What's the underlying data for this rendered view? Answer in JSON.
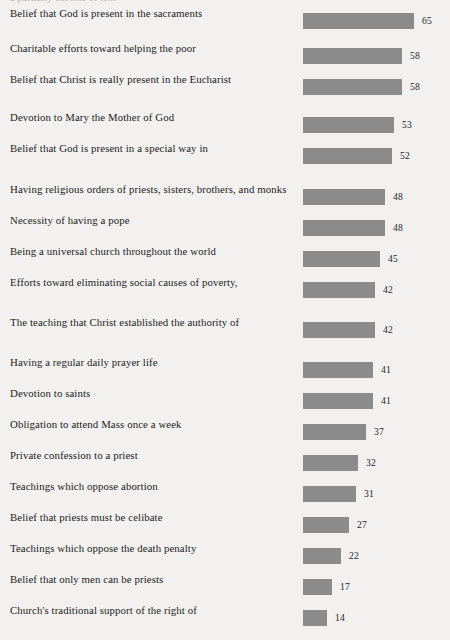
{
  "top_clipped_text": "a partially cut line of text",
  "colors": {
    "background": "#f2f1ef",
    "bar": "#8b8b8b",
    "text": "#1d1c1b"
  },
  "chart_data": {
    "type": "bar",
    "orientation": "horizontal",
    "title": "",
    "subtitle": "",
    "xlabel": "",
    "ylabel": "",
    "xlim": [
      0,
      65
    ],
    "grid": false,
    "legend": false,
    "value_labels": true,
    "categories": [
      "Belief that God is present in the sacraments",
      "Charitable efforts toward helping the poor",
      "Belief that Christ is really present in the Eucharist",
      "Devotion to Mary the Mother of God",
      "Belief that God is present in a special way in the poor",
      "Having religious orders of priests, sisters, brothers, and monks",
      "Necessity of having a pope",
      "Being a universal church throughout the world",
      "Efforts toward eliminating social causes of poverty, such as unequal wages and discrimination",
      "The teaching that Christ established the authority of the bishops by choosing Peter",
      "Having a regular daily prayer life",
      "Devotion to saints",
      "Obligation to attend Mass once a week",
      "Private confession to a priest",
      "Teachings which oppose abortion",
      "Belief that priests must be celibate",
      "Teachings which oppose the death penalty",
      "Belief that only men can be priests",
      "Church's traditional support of the right of workers to unionize"
    ],
    "values": [
      65,
      58,
      58,
      53,
      52,
      48,
      48,
      45,
      42,
      42,
      41,
      41,
      37,
      32,
      31,
      27,
      22,
      17,
      14
    ],
    "rows": [
      {
        "line1": "Belief that God is present in the sacraments",
        "line2": "",
        "value": 65,
        "value_text": "65"
      },
      {
        "line1": "Charitable efforts toward helping the poor",
        "line2": "",
        "value": 58,
        "value_text": "58"
      },
      {
        "line1": "Belief that Christ is really present in the Eucharist",
        "line2": "",
        "value": 58,
        "value_text": "58"
      },
      {
        "line1": "Devotion to Mary the Mother of God",
        "line2": "",
        "value": 53,
        "value_text": "53"
      },
      {
        "line1": "Belief that God is present in a special way in",
        "line2": "the poor",
        "value": 52,
        "value_text": "52"
      },
      {
        "line1": "Having religious orders of priests, sisters, brothers, and monks",
        "line2": "",
        "value": 48,
        "value_text": "48"
      },
      {
        "line1": "Necessity of having a pope",
        "line2": "",
        "value": 48,
        "value_text": "48"
      },
      {
        "line1": "Being a universal church throughout the world",
        "line2": "",
        "value": 45,
        "value_text": "45"
      },
      {
        "line1": "Efforts toward eliminating social causes of poverty,",
        "line2": "such as unequal wages and discrimination",
        "value": 42,
        "value_text": "42"
      },
      {
        "line1": "The teaching that Christ established the authority of",
        "line2": "the bishops by choosing Peter",
        "value": 42,
        "value_text": "42"
      },
      {
        "line1": "Having a regular daily prayer life",
        "line2": "",
        "value": 41,
        "value_text": "41"
      },
      {
        "line1": "Devotion to saints",
        "line2": "",
        "value": 41,
        "value_text": "41"
      },
      {
        "line1": "Obligation to attend Mass once a week",
        "line2": "",
        "value": 37,
        "value_text": "37"
      },
      {
        "line1": "Private confession to a priest",
        "line2": "",
        "value": 32,
        "value_text": "32"
      },
      {
        "line1": "Teachings which oppose abortion",
        "line2": "",
        "value": 31,
        "value_text": "31"
      },
      {
        "line1": "Belief that priests must be celibate",
        "line2": "",
        "value": 27,
        "value_text": "27"
      },
      {
        "line1": "Teachings which oppose the death penalty",
        "line2": "",
        "value": 22,
        "value_text": "22"
      },
      {
        "line1": "Belief that only men can be priests",
        "line2": "",
        "value": 17,
        "value_text": "17"
      },
      {
        "line1": "Church's traditional support of the right of",
        "line2": "workers to unionize",
        "value": 14,
        "value_text": "14"
      }
    ]
  }
}
